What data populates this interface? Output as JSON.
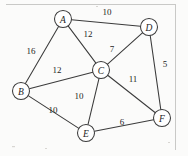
{
  "figure": {
    "background_color": "#fbfbfa",
    "edge_color": "#3b3b3b",
    "node_fill": "#ffffff",
    "frame_color": "#c9c9c7"
  },
  "chart_data": {
    "type": "diagram",
    "nodes": [
      {
        "id": "A",
        "label": "A",
        "x": 63,
        "y": 19,
        "r": 8.5
      },
      {
        "id": "B",
        "label": "B",
        "x": 21,
        "y": 91,
        "r": 8.5
      },
      {
        "id": "C",
        "label": "C",
        "x": 101,
        "y": 70,
        "r": 8.5
      },
      {
        "id": "D",
        "label": "D",
        "x": 149,
        "y": 27,
        "r": 8.5
      },
      {
        "id": "E",
        "label": "E",
        "x": 86,
        "y": 133,
        "r": 8.5
      },
      {
        "id": "F",
        "label": "F",
        "x": 162,
        "y": 118,
        "r": 8.5
      }
    ],
    "edges": [
      {
        "from": "A",
        "to": "D",
        "weight": 10,
        "label_x": 107,
        "label_y": 12
      },
      {
        "from": "A",
        "to": "B",
        "weight": 16,
        "label_x": 31,
        "label_y": 51
      },
      {
        "from": "A",
        "to": "C",
        "weight": 12,
        "label_x": 88,
        "label_y": 34
      },
      {
        "from": "C",
        "to": "D",
        "weight": 7,
        "label_x": 112,
        "label_y": 49
      },
      {
        "from": "B",
        "to": "C",
        "weight": 12,
        "label_x": 57,
        "label_y": 70
      },
      {
        "from": "D",
        "to": "F",
        "weight": 5,
        "label_x": 165,
        "label_y": 64
      },
      {
        "from": "C",
        "to": "F",
        "weight": 11,
        "label_x": 133,
        "label_y": 79
      },
      {
        "from": "C",
        "to": "E",
        "weight": 10,
        "label_x": 79,
        "label_y": 96
      },
      {
        "from": "B",
        "to": "E",
        "weight": 10,
        "label_x": 53,
        "label_y": 110
      },
      {
        "from": "E",
        "to": "F",
        "weight": 6,
        "label_x": 122,
        "label_y": 122
      }
    ],
    "node_count": 6,
    "edge_count": 10
  }
}
